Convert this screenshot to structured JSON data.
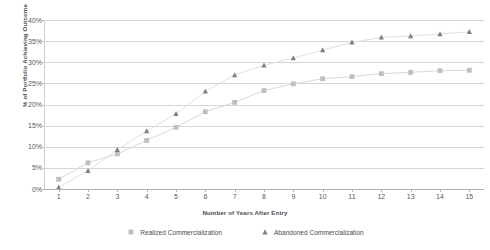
{
  "chart_data": {
    "type": "line",
    "title": "",
    "xlabel": "Number of Years After Entry",
    "ylabel": "% of Portfolio Achieving Outcome",
    "categories": [
      "1",
      "2",
      "3",
      "4",
      "5",
      "6",
      "7",
      "8",
      "9",
      "10",
      "11",
      "12",
      "13",
      "14",
      "15"
    ],
    "x": [
      1,
      2,
      3,
      4,
      5,
      6,
      7,
      8,
      9,
      10,
      11,
      12,
      13,
      14,
      15
    ],
    "ylim": [
      0,
      40
    ],
    "xlim": [
      1,
      15
    ],
    "ytick_labels": [
      "0%",
      "5%",
      "10%",
      "15%",
      "20%",
      "25%",
      "30%",
      "35%",
      "40%"
    ],
    "ytick_values": [
      0,
      5,
      10,
      15,
      20,
      25,
      30,
      35,
      40
    ],
    "grid": true,
    "legend_position": "bottom",
    "series": [
      {
        "name": "Realized Commercialization",
        "marker": "square",
        "color": "#bfbfbf",
        "line_color": "#d9d9d9",
        "values": [
          2.3,
          6.2,
          8.3,
          11.5,
          14.6,
          18.3,
          20.5,
          23.3,
          24.9,
          26.1,
          26.6,
          27.3,
          27.6,
          28.0,
          28.1
        ]
      },
      {
        "name": "Abandoned Commercialization",
        "marker": "triangle",
        "color": "#808080",
        "line_color": "#e0e0e0",
        "values": [
          0.4,
          4.3,
          9.3,
          13.7,
          17.8,
          23.1,
          27.0,
          29.3,
          31.0,
          32.9,
          34.7,
          35.9,
          36.2,
          36.7,
          37.2
        ]
      }
    ]
  },
  "legend": {
    "items": [
      {
        "label": "Realized Commercialization",
        "marker": "square-marker-icon"
      },
      {
        "label": "Abandoned Commercialization",
        "marker": "triangle-marker-icon"
      }
    ]
  }
}
